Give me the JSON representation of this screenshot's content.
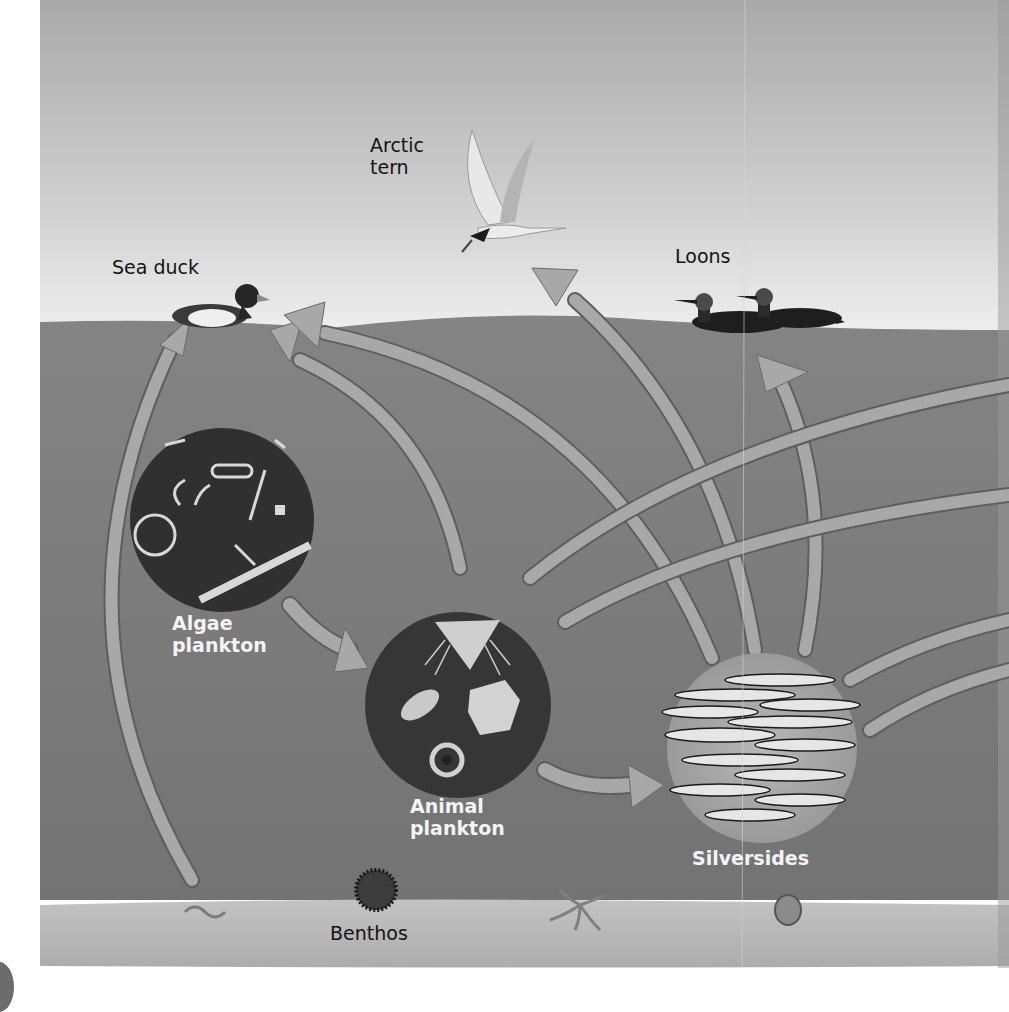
{
  "diagram": {
    "type": "marine food web",
    "colors": {
      "sky_top": "#a9a9a9",
      "sky_bottom": "#eeeeee",
      "water": "#7a7a7a",
      "seabed": "#b9b9b9",
      "arrow": "#a4a4a4",
      "arrow_shadow": "#5a5a5a",
      "circle_dark": "#333333",
      "label_dark": "#141414",
      "label_light": "#f4f4f4"
    },
    "organisms": [
      {
        "id": "sea-duck",
        "label": "Sea duck",
        "zone": "surface"
      },
      {
        "id": "arctic-tern",
        "label_line1": "Arctic",
        "label_line2": "tern",
        "zone": "air"
      },
      {
        "id": "loons",
        "label": "Loons",
        "zone": "surface"
      },
      {
        "id": "algae-plankton",
        "label_line1": "Algae",
        "label_line2": "plankton",
        "zone": "water"
      },
      {
        "id": "animal-plankton",
        "label_line1": "Animal",
        "label_line2": "plankton",
        "zone": "water"
      },
      {
        "id": "silversides",
        "label": "Silversides",
        "zone": "water"
      },
      {
        "id": "benthos",
        "label": "Benthos",
        "zone": "seabed"
      }
    ],
    "links": [
      {
        "from": "benthos",
        "to": "sea-duck"
      },
      {
        "from": "algae-plankton",
        "to": "animal-plankton"
      },
      {
        "from": "animal-plankton",
        "to": "sea-duck"
      },
      {
        "from": "animal-plankton",
        "to": "silversides"
      },
      {
        "from": "animal-plankton",
        "to": "offscreen-right"
      },
      {
        "from": "silversides",
        "to": "sea-duck"
      },
      {
        "from": "silversides",
        "to": "arctic-tern"
      },
      {
        "from": "silversides",
        "to": "loons"
      },
      {
        "from": "silversides",
        "to": "offscreen-right"
      }
    ]
  },
  "labels": {
    "sea_duck": "Sea duck",
    "arctic_tern_1": "Arctic",
    "arctic_tern_2": "tern",
    "loons": "Loons",
    "algae_1": "Algae",
    "algae_2": "plankton",
    "animal_1": "Animal",
    "animal_2": "plankton",
    "silversides": "Silversides",
    "benthos": "Benthos"
  }
}
